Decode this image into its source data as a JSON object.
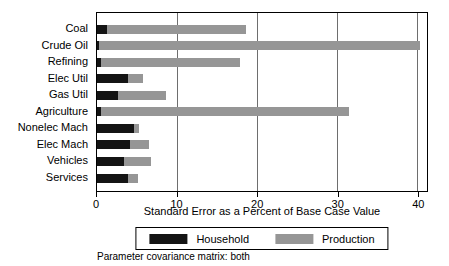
{
  "chart_data": {
    "type": "bar",
    "orientation": "horizontal",
    "stacked": true,
    "title": "",
    "categories": [
      "Coal",
      "Crude Oil",
      "Refining",
      "Elec Util",
      "Gas Util",
      "Agriculture",
      "Nonelec Mach",
      "Elec Mach",
      "Vehicles",
      "Services"
    ],
    "series": [
      {
        "name": "Household",
        "color": "#141414",
        "values": [
          1.3,
          0.2,
          0.5,
          3.9,
          2.6,
          0.5,
          4.6,
          4.1,
          3.4,
          3.9
        ]
      },
      {
        "name": "Production",
        "color": "#969696",
        "values": [
          17.2,
          39.9,
          17.3,
          1.8,
          6.0,
          30.8,
          0.6,
          2.3,
          3.3,
          1.2
        ]
      }
    ],
    "totals": [
      18.5,
      40.1,
      17.8,
      5.7,
      8.6,
      31.3,
      5.2,
      6.4,
      6.7,
      5.1
    ],
    "xlabel": "Standard Error as a Percent of Base Case Value",
    "ylabel": "",
    "xticks": [
      0,
      10,
      20,
      30,
      40
    ],
    "xlim": [
      0,
      41.2
    ],
    "grid": true,
    "gridline_color": "#6e6e6e",
    "legend": {
      "position": "bottom",
      "entries": [
        "Household",
        "Production"
      ]
    },
    "caption": "Parameter covariance matrix: both"
  }
}
